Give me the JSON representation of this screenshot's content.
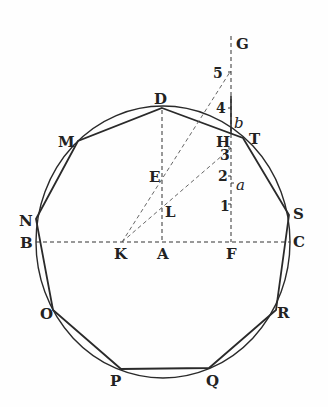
{
  "figure": {
    "circle": {
      "cx": 163,
      "cy": 242,
      "rx": 127,
      "ry": 136
    },
    "polygon_vertices": [
      {
        "name": "D",
        "x": 162,
        "y": 108
      },
      {
        "name": "T",
        "x": 243,
        "y": 138
      },
      {
        "name": "S",
        "x": 289,
        "y": 215
      },
      {
        "name": "R",
        "x": 276,
        "y": 310
      },
      {
        "name": "Q",
        "x": 209,
        "y": 368
      },
      {
        "name": "P",
        "x": 121,
        "y": 369
      },
      {
        "name": "O",
        "x": 53,
        "y": 310
      },
      {
        "name": "N",
        "x": 36,
        "y": 219
      },
      {
        "name": "M",
        "x": 78,
        "y": 141
      }
    ],
    "labels": {
      "D": "D",
      "T": "T",
      "S": "S",
      "C": "C",
      "R": "R",
      "Q": "Q",
      "P": "P",
      "O": "O",
      "B": "B",
      "N": "N",
      "M": "M",
      "K": "K",
      "A": "A",
      "F": "F",
      "E": "E",
      "L": "L",
      "H": "H",
      "G": "G",
      "a": "a",
      "b": "b",
      "n1": "1",
      "n2": "2",
      "n3": "3",
      "n4": "4",
      "n5": "5"
    },
    "points": {
      "A": {
        "x": 163,
        "y": 242
      },
      "B": {
        "x": 36,
        "y": 242
      },
      "C": {
        "x": 290,
        "y": 242
      },
      "K": {
        "x": 122,
        "y": 242
      },
      "F": {
        "x": 231,
        "y": 242
      },
      "E": {
        "x": 162,
        "y": 178
      },
      "L": {
        "x": 162,
        "y": 205
      },
      "H": {
        "x": 231,
        "y": 140
      },
      "G": {
        "x": 231,
        "y": 36
      },
      "p5": {
        "x": 230,
        "y": 72
      }
    }
  }
}
